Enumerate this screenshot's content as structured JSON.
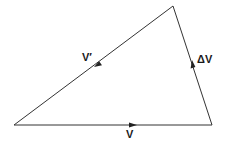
{
  "diagram": {
    "type": "vector-triangle",
    "vertices": {
      "bottom_left": [
        14,
        125
      ],
      "bottom_right": [
        212,
        125
      ],
      "top": [
        173,
        6
      ]
    },
    "vectors": [
      {
        "id": "v",
        "label": "V",
        "from": "bottom_left",
        "to": "bottom_right",
        "arrow_position": [
          133,
          125
        ],
        "arrow_direction": "right"
      },
      {
        "id": "delta_v",
        "label": "ΔV",
        "from": "bottom_right",
        "to": "top",
        "arrow_position": [
          193,
          63
        ],
        "arrow_direction": "up"
      },
      {
        "id": "v_prime",
        "label": "V′",
        "from": "top",
        "to": "bottom_left",
        "arrow_position": [
          97,
          65
        ],
        "arrow_direction": "down-left"
      }
    ],
    "line_color": "#333333",
    "label_color": "#1a1a1a"
  }
}
